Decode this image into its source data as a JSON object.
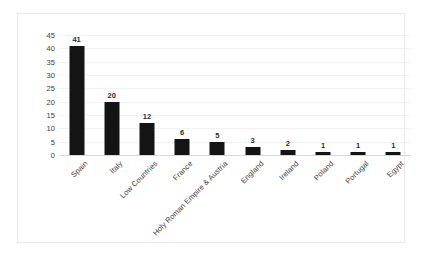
{
  "chart_data": {
    "type": "bar",
    "title": "",
    "xlabel": "",
    "ylabel": "",
    "ylim": [
      0,
      45
    ],
    "yticks": [
      0,
      5,
      10,
      15,
      20,
      25,
      30,
      35,
      40,
      45
    ],
    "grid": true,
    "legend": false,
    "bar_color": "#141414",
    "categories": [
      "Spain",
      "Italy",
      "Low Countries",
      "France",
      "Holy Roman Empire & Austria",
      "England",
      "Ireland",
      "Poland",
      "Portugal",
      "Egypt"
    ],
    "values": [
      41,
      20,
      12,
      6,
      5,
      3,
      2,
      1,
      1,
      1
    ],
    "data_labels": [
      "41",
      "20",
      "12",
      "6",
      "5",
      "3",
      "2",
      "1",
      "1",
      "1"
    ]
  }
}
